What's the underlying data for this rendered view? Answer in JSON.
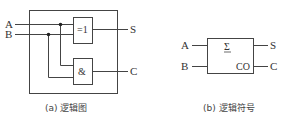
{
  "logic_diagram": {
    "inputs": [
      "A",
      "B"
    ],
    "outputs": [
      "S",
      "C"
    ],
    "gates": [
      {
        "type": "xor",
        "label": "=1"
      },
      {
        "type": "and",
        "label": "&"
      }
    ],
    "caption": "(a) 逻辑图"
  },
  "logic_symbol": {
    "inputs": [
      "A",
      "B"
    ],
    "outputs": [
      "S",
      "C"
    ],
    "function_label": "Σ",
    "carry_pin_label": "CO",
    "caption": "(b) 逻辑符号"
  },
  "colors": {
    "line": "#444444",
    "background": "#ffffff"
  }
}
